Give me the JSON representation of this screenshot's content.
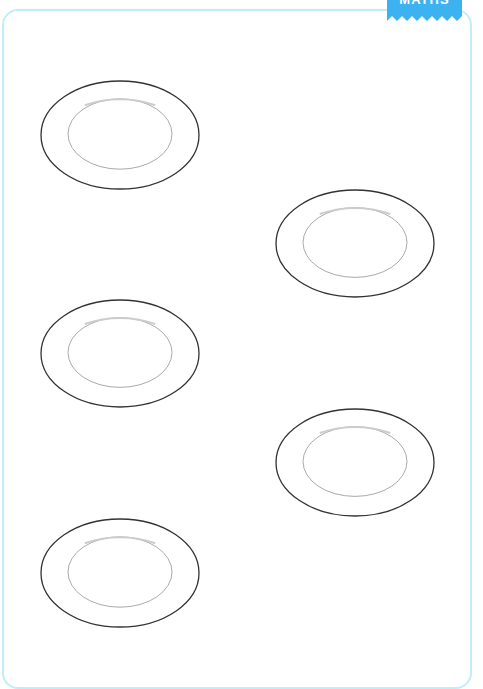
{
  "worksheet": {
    "tab": {
      "label": "MATHS",
      "color": "#3db2f0"
    },
    "border_color": "#bfeef8",
    "plates": [
      {
        "x": 40,
        "y": 80,
        "w": 160,
        "h": 110
      },
      {
        "x": 275,
        "y": 189,
        "w": 160,
        "h": 109
      },
      {
        "x": 40,
        "y": 299,
        "w": 160,
        "h": 109
      },
      {
        "x": 275,
        "y": 408,
        "w": 160,
        "h": 109
      },
      {
        "x": 40,
        "y": 518,
        "w": 160,
        "h": 110
      }
    ]
  }
}
